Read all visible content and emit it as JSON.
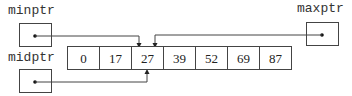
{
  "diagram": {
    "type": "pointer-array",
    "pointers": [
      {
        "name": "minptr",
        "target_index": 2
      },
      {
        "name": "maxptr",
        "target_index": 2
      },
      {
        "name": "midptr",
        "target_index": 2
      }
    ],
    "array": {
      "values": [
        "0",
        "17",
        "27",
        "39",
        "52",
        "69",
        "87"
      ]
    }
  }
}
